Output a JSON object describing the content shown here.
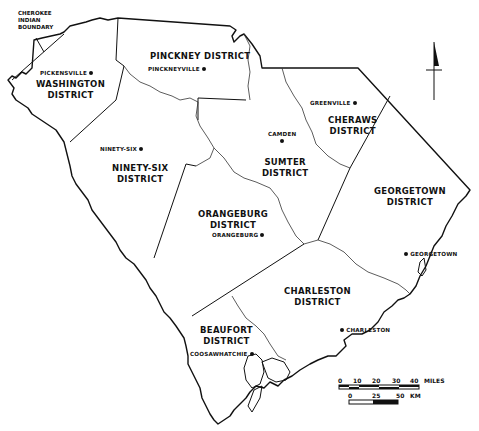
{
  "map": {
    "title": "South Carolina Judicial Districts",
    "districts": [
      {
        "name": "Washington District",
        "label": "WASHINGTON\nDISTRICT"
      },
      {
        "name": "Pinckney District",
        "label": "PINCKNEY DISTRICT"
      },
      {
        "name": "Cheraws District",
        "label": "CHERAWS\nDISTRICT"
      },
      {
        "name": "Ninety-Six District",
        "label": "NINETY-SIX\nDISTRICT"
      },
      {
        "name": "Sumter District",
        "label": "SUMTER\nDISTRICT"
      },
      {
        "name": "Georgetown District",
        "label": "GEORGETOWN\nDISTRICT"
      },
      {
        "name": "Orangeburg District",
        "label": "ORANGEBURG\nDISTRICT"
      },
      {
        "name": "Charleston District",
        "label": "CHARLESTON\nDISTRICT"
      },
      {
        "name": "Beaufort District",
        "label": "BEAUFORT\nDISTRICT"
      }
    ],
    "towns": [
      {
        "name": "PICKENSVILLE"
      },
      {
        "name": "PINCKNEYVILLE"
      },
      {
        "name": "GREENVILLE"
      },
      {
        "name": "CAMDEN"
      },
      {
        "name": "NINETY-SIX"
      },
      {
        "name": "ORANGEBURG"
      },
      {
        "name": "GEORGETOWN"
      },
      {
        "name": "CHARLESTON"
      },
      {
        "name": "COOSAWHATCHIE"
      }
    ],
    "annotation": "CHEROKEE\nINDIAN\nBOUNDARY",
    "north_arrow": "north-arrow",
    "scale_miles": {
      "ticks": [
        "0",
        "10",
        "20",
        "30",
        "40"
      ],
      "unit": "MILES"
    },
    "scale_km": {
      "ticks": [
        "0",
        "25",
        "50"
      ],
      "unit": "KM"
    }
  }
}
